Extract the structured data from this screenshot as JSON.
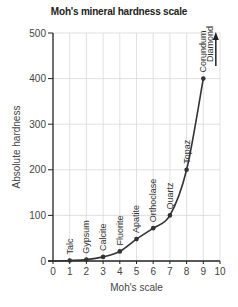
{
  "chart_data": {
    "type": "line",
    "title": "Moh's mineral hardness scale",
    "xlabel": "Moh's scale",
    "ylabel": "Absolute hardness",
    "xlim": [
      0,
      10
    ],
    "ylim": [
      0,
      500
    ],
    "x_ticks": [
      "0",
      "1",
      "2",
      "3",
      "4",
      "5",
      "6",
      "7",
      "8",
      "9",
      "10"
    ],
    "y_ticks": [
      "0",
      "100",
      "200",
      "300",
      "400",
      "500"
    ],
    "grid": true,
    "series": [
      {
        "name": "Absolute hardness",
        "points": [
          {
            "x": 1,
            "y": 1,
            "label": "Talc"
          },
          {
            "x": 2,
            "y": 3,
            "label": "Gypsum"
          },
          {
            "x": 3,
            "y": 9,
            "label": "Calcite"
          },
          {
            "x": 4,
            "y": 21,
            "label": "Fluorite"
          },
          {
            "x": 5,
            "y": 48,
            "label": "Apatite"
          },
          {
            "x": 6,
            "y": 72,
            "label": "Orthoclase"
          },
          {
            "x": 7,
            "y": 100,
            "label": "Quartz"
          },
          {
            "x": 8,
            "y": 200,
            "label": "Topaz"
          },
          {
            "x": 9,
            "y": 400,
            "label": "Corundum"
          }
        ]
      }
    ],
    "annotations": [
      {
        "text": "Diamond",
        "x": 10,
        "note": "off-scale, arrow pointing upward (~1500)"
      }
    ],
    "colors": {
      "line": "#333333",
      "grid": "#d9d9d9",
      "axis": "#222222"
    }
  }
}
